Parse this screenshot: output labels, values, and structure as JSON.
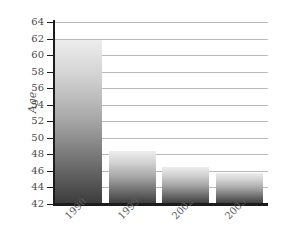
{
  "chart_data": {
    "type": "bar",
    "title": "",
    "xlabel": "",
    "ylabel": "Age",
    "categories": [
      "1990",
      "1999",
      "2002",
      "2003"
    ],
    "values": [
      61.8,
      48.4,
      46.5,
      45.8
    ],
    "ylim": [
      42,
      64
    ],
    "ytick_step": 2,
    "yticks": [
      64,
      62,
      60,
      58,
      56,
      54,
      52,
      50,
      48,
      46,
      44,
      42
    ],
    "grid": true,
    "legend": "none",
    "series": [
      {
        "name": "Age",
        "values": [
          61.8,
          48.4,
          46.5,
          45.8
        ]
      }
    ]
  },
  "style": {
    "bar_gradient_top": "#ededed",
    "bar_gradient_bottom": "#3b3b3b",
    "gridline_color": "#b9b9b9",
    "axis_color": "#1c1c1c",
    "tick_label_color": "#4a4a4a",
    "background": "#ffffff"
  }
}
